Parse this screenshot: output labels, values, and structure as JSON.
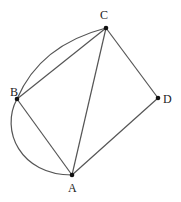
{
  "diagram": {
    "points": {
      "A": {
        "label": "A",
        "x": 72,
        "y": 175
      },
      "B": {
        "label": "B",
        "x": 17,
        "y": 99
      },
      "C": {
        "label": "C",
        "x": 106,
        "y": 28
      },
      "D": {
        "label": "D",
        "x": 158,
        "y": 98
      }
    },
    "segments": [
      "AB",
      "BC",
      "CA",
      "CD",
      "DA"
    ],
    "arcs": [
      "BC",
      "BA"
    ],
    "colors": {
      "stroke": "#555555",
      "point": "#111111",
      "text": "#222222"
    }
  }
}
